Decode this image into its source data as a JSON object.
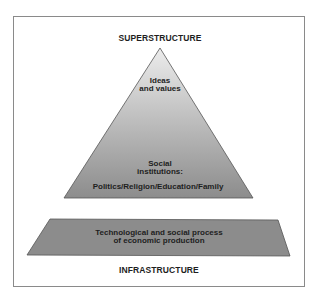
{
  "diagram": {
    "type": "base-superstructure",
    "colors": {
      "frame": "#8a8a8a",
      "pyramid_top": "#e6e6e6",
      "pyramid_bottom": "#8f8f8f",
      "base_fill": "#8c8c8c",
      "outline": "#555555",
      "text": "#1e1e1e"
    },
    "top_label": "SUPERSTRUCTURE",
    "bottom_label": "INFRASTRUCTURE",
    "pyramid": {
      "upper_text_line1": "Ideas",
      "upper_text_line2": "and values",
      "lower_text_line1": "Social",
      "lower_text_line2": "institutions:",
      "lower_text_line3": "Politics/Religion/Education/Family"
    },
    "base": {
      "text_line1": "Technological and social process",
      "text_line2": "of economic production"
    }
  }
}
